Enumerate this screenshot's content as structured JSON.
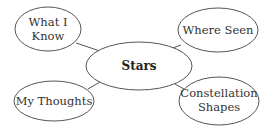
{
  "diagram": {
    "type": "concept-web",
    "center": {
      "label": "Stars"
    },
    "nodes": [
      {
        "id": "top-left",
        "lines": [
          "What I",
          "Know"
        ]
      },
      {
        "id": "top-right",
        "lines": [
          "Where Seen"
        ]
      },
      {
        "id": "bottom-left",
        "lines": [
          "My Thoughts"
        ]
      },
      {
        "id": "bottom-right",
        "lines": [
          "Constellation",
          "Shapes"
        ]
      }
    ],
    "colors": {
      "stroke": "#555555",
      "text": "#333333",
      "background": "#ffffff"
    }
  }
}
